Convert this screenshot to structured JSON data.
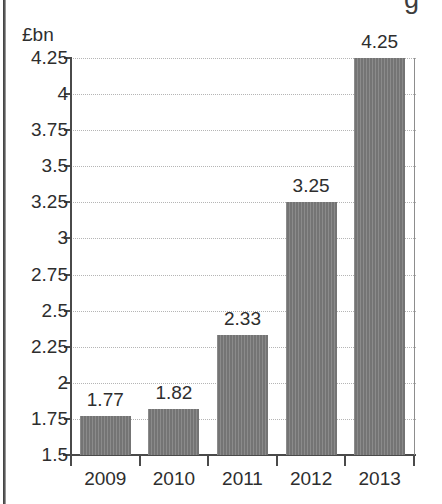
{
  "chart_data": {
    "type": "bar",
    "title": "",
    "subtitle": "",
    "xlabel": "",
    "ylabel": "£bn",
    "unit_label": "£bn",
    "categories": [
      "2009",
      "2010",
      "2011",
      "2012",
      "2013"
    ],
    "values": [
      1.77,
      1.82,
      2.33,
      3.25,
      4.25
    ],
    "value_labels": [
      "1.77",
      "1.82",
      "2.33",
      "3.25",
      "4.25"
    ],
    "series": [
      {
        "name": "",
        "values": [
          1.77,
          1.82,
          2.33,
          3.25,
          4.25
        ]
      }
    ],
    "ylim": [
      1.5,
      4.25
    ],
    "ytick_step": 0.25,
    "ytick_labels": [
      "4.25",
      "4",
      "3.75",
      "3.5",
      "3.25",
      "3",
      "2.75",
      "2.5",
      "2.25",
      "2",
      "1.75",
      "1.5"
    ],
    "ytick_values": [
      4.25,
      4,
      3.75,
      3.5,
      3.25,
      3,
      2.75,
      2.5,
      2.25,
      2,
      1.75,
      1.5
    ],
    "grid": true,
    "grid_style": "dotted",
    "legend": false,
    "legend_position": "none",
    "bar_color": "#7a7a7a",
    "grid_color": "#b5b5b5",
    "axis_color": "#4a4a4a",
    "text_color": "#2e2e2e",
    "data_labels_shown": true
  },
  "artifacts": {
    "cropped_glyph": "g"
  }
}
